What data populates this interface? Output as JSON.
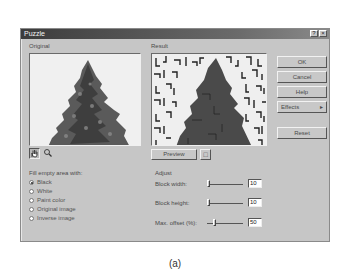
{
  "window": {
    "title": "Puzzle",
    "help_glyph": "?",
    "close_glyph": "×"
  },
  "panels": {
    "original_label": "Original",
    "result_label": "Result"
  },
  "buttons": {
    "ok": "OK",
    "cancel": "Cancel",
    "help": "Help",
    "effects": "Effects",
    "effects_arrow": "▸",
    "reset": "Reset",
    "preview": "Preview"
  },
  "tools": {
    "hand": "✋",
    "zoom": "🔍",
    "preview_toggle": "□"
  },
  "fill": {
    "label": "Fill empty area with:",
    "options": [
      {
        "label": "Black",
        "selected": true
      },
      {
        "label": "White",
        "selected": false
      },
      {
        "label": "Paint color",
        "selected": false
      },
      {
        "label": "Original image",
        "selected": false
      },
      {
        "label": "Inverse image",
        "selected": false
      }
    ]
  },
  "adjust": {
    "label": "Adjust",
    "params": [
      {
        "label": "Block width:",
        "value": "10"
      },
      {
        "label": "Block height:",
        "value": "10"
      },
      {
        "label": "Max. offset (%):",
        "value": "50"
      }
    ]
  },
  "caption": "(a)"
}
